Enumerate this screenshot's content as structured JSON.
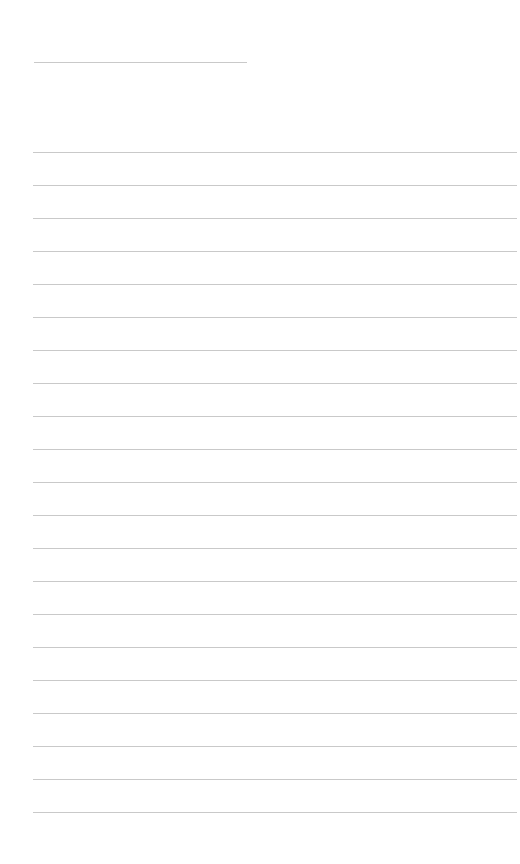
{
  "page": {
    "type": "lined-paper",
    "background_color": "#ffffff",
    "line_color": "#c9c9c9"
  },
  "title_line": {
    "left": 34,
    "top": 62,
    "width": 213
  },
  "ruled_lines": {
    "count": 21,
    "left": 33,
    "first_top": 152,
    "spacing": 33,
    "width": 484
  }
}
